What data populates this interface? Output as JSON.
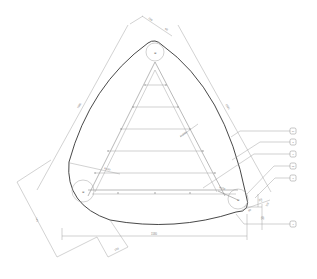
{
  "drawing": {
    "title": "Triangular rounded frame assembly — plan view",
    "dimensions": {
      "top_width": "250",
      "top_offset": "60",
      "left_side": "1580",
      "right_side": "1580",
      "left_lower": "740",
      "bottom_offset": "150",
      "bottom_overall": "1580",
      "right_small_1": "25",
      "right_small_2": "100",
      "right_small_3": "60",
      "right_small_4": "30",
      "diagonal_note": "R1500",
      "left_note": "R450",
      "corner_note": "R100"
    },
    "callouts": [
      {
        "id": "c1",
        "label": "10"
      },
      {
        "id": "c2",
        "label": "5"
      },
      {
        "id": "c3",
        "label": "6"
      },
      {
        "id": "c4",
        "label": "12"
      },
      {
        "id": "c5",
        "label": "8"
      },
      {
        "id": "c6",
        "label": "7"
      }
    ],
    "corner_marks": {
      "top": "⊕",
      "left": "⊕",
      "right": "⊕"
    }
  }
}
